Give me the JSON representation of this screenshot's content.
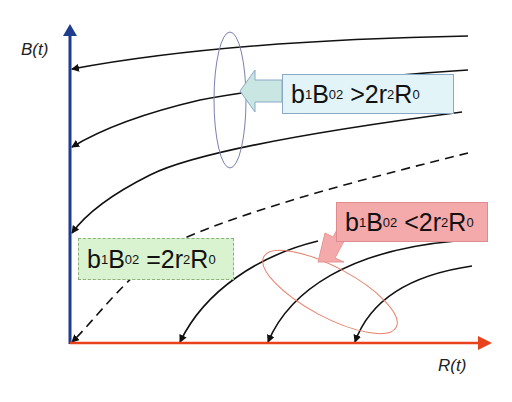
{
  "axes": {
    "y_label": "B(t)",
    "x_label": "R(t)",
    "y_axis_color": "#1f3d8f",
    "x_axis_color": "#e8421c"
  },
  "annotations": {
    "gt": {
      "b": "b",
      "b_sub": "1",
      "B": "B",
      "B_sub": "0",
      "B_sup": "2",
      "rel": " >2r",
      "r_sub": "2",
      "R": "R",
      "R_sub": "0",
      "bg": "#e2f4f8"
    },
    "eq": {
      "b": "b",
      "b_sub": "1",
      "B": "B",
      "B_sub": "0",
      "B_sup": "2",
      "rel": " =2r",
      "r_sub": "2",
      "R": "R",
      "R_sub": "0",
      "bg": "#d9f2cf"
    },
    "lt": {
      "b": "b",
      "b_sub": "1",
      "B": "B",
      "B_sub": "0",
      "B_sup": "2",
      "rel": " <2r",
      "r_sub": "2",
      "R": "R",
      "R_sub": "0",
      "bg": "#f4a9ab"
    }
  },
  "curves": {
    "upper_group": "trajectories ending on B axis (b1B0^2 > 2r2R0)",
    "separatrix": "dashed curve ending at origin (b1B0^2 = 2r2R0)",
    "lower_group": "trajectories ending on R axis (b1B0^2 < 2r2R0)"
  }
}
